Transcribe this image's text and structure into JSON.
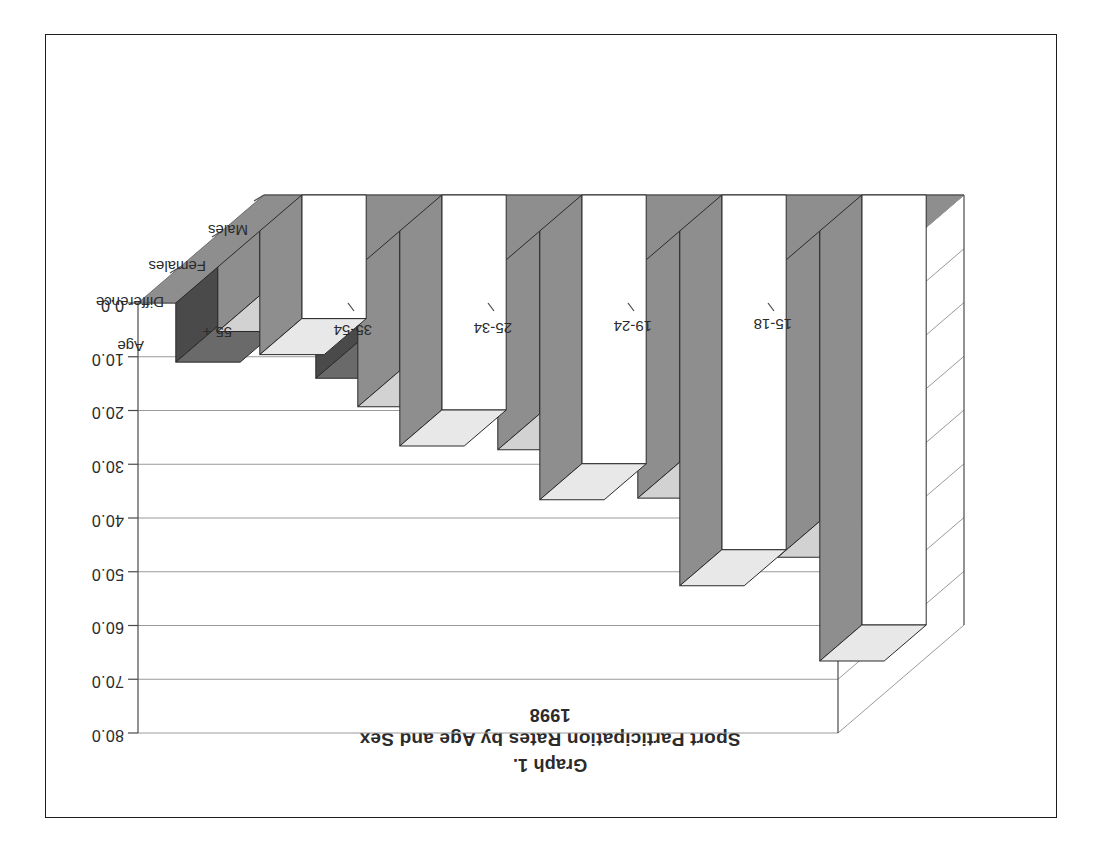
{
  "page": {
    "background": "#ffffff",
    "border_color": "#1d1d1d",
    "rotated_180": "true"
  },
  "titles": {
    "graph_number": "Graph 1.",
    "main": "Sport Participation Rates by Age and Sex",
    "year": "1998"
  },
  "axes": {
    "y_ticks": [
      "0.0",
      "10.0",
      "20.0",
      "30.0",
      "40.0",
      "50.0",
      "60.0",
      "70.0",
      "80.0"
    ],
    "category_axis_title": "Age",
    "categories": [
      "15-18",
      "19-24",
      "25-34",
      "35-54",
      "55 +"
    ],
    "series_labels": [
      "Males",
      "Females",
      "Difference"
    ]
  },
  "colors": {
    "males": "#ffffff",
    "females": "#8e8e8e",
    "difference": "#4a4a4a",
    "floor": "#8e8e8e",
    "gridline": "#9a9a9a",
    "outline": "#2a2a2a",
    "text": "#2b2b2b"
  },
  "chart_data": {
    "type": "bar",
    "title": "Sport Participation Rates by Age and Sex",
    "subtitle": "1998",
    "graph_number": "Graph 1.",
    "xlabel": "Age",
    "ylabel": "",
    "ylim": [
      0,
      80
    ],
    "ytick_step": 10,
    "grid": "horizontal",
    "three_d": "true",
    "legend": "axis-labels-on-depth-axis",
    "categories": [
      "15-18",
      "19-24",
      "25-34",
      "35-54",
      "55 +"
    ],
    "series": [
      {
        "name": "Males",
        "values": [
          80.0,
          66.0,
          50.0,
          40.0,
          23.0
        ]
      },
      {
        "name": "Females",
        "values": [
          54.0,
          43.0,
          34.0,
          26.0,
          12.0
        ]
      },
      {
        "name": "Difference",
        "values": [
          26.0,
          23.0,
          16.0,
          14.0,
          11.0
        ]
      }
    ]
  }
}
